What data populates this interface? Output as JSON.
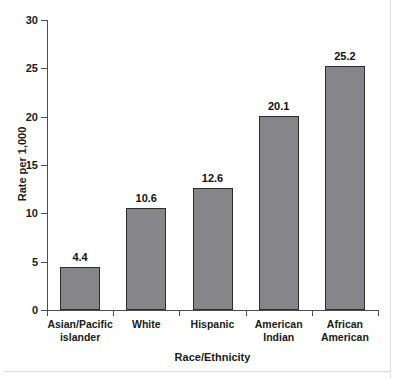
{
  "chart_data": {
    "type": "bar",
    "title": "",
    "subtitle": "",
    "xlabel": "Race/Ethnicity",
    "ylabel": "Rate per 1,000",
    "categories": [
      "Asian/Pacific\nislander",
      "White",
      "Hispanic",
      "American\nIndian",
      "African\nAmerican"
    ],
    "values": [
      4.4,
      10.6,
      12.6,
      20.1,
      25.2
    ],
    "value_labels": [
      "4.4",
      "10.6",
      "12.6",
      "20.1",
      "25.2"
    ],
    "ylim": [
      0,
      30
    ],
    "ytick_values": [
      0,
      5,
      10,
      15,
      20,
      25,
      30
    ],
    "ytick_labels": [
      "0",
      "5",
      "10",
      "15",
      "20",
      "25",
      "30"
    ],
    "grid": false,
    "legend": null,
    "bar_color": "#85858a",
    "bar_edge_color": "#2b2b2b",
    "axis_color": "#4d4d4d",
    "text_color": "#1a1a1a"
  }
}
